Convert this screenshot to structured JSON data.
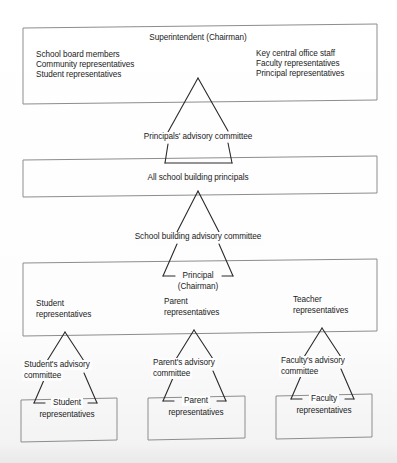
{
  "figure": {
    "kind": "organizational-hierarchy-diagram",
    "levels": 5
  },
  "boxes": {
    "superintendent": {
      "title": "Superintendent (Chairman)",
      "left_column": [
        "School board members",
        "Community representatives",
        "Student representatives"
      ],
      "right_column": [
        "Key central office staff",
        "Faculty representatives",
        "Principal representatives"
      ]
    },
    "principals": {
      "title": "All school building principals"
    },
    "building": {
      "principal_line1": "Principal",
      "principal_line2": "(Chairman)",
      "groups": [
        {
          "line1": "Student",
          "line2": "representatives"
        },
        {
          "line1": "Parent",
          "line2": "representatives"
        },
        {
          "line1": "Teacher",
          "line2": "representatives"
        }
      ]
    },
    "bottom": [
      {
        "line1": "Student",
        "line2": "representatives"
      },
      {
        "line1": "Parent",
        "line2": "representatives"
      },
      {
        "line1": "Faculty",
        "line2": "representatives"
      }
    ]
  },
  "connectors": {
    "principals_advisory": "Principals' advisory committee",
    "school_building_advisory": "School building advisory committee",
    "advisory": [
      {
        "line1": "Student's advisory",
        "line2": "committee"
      },
      {
        "line1": "Parent's advisory",
        "line2": "committee"
      },
      {
        "line1": "Faculty's advisory",
        "line2": "committee"
      }
    ]
  },
  "style": {
    "ink": "#2a2a2a",
    "box_stroke": "#8d8d8d",
    "paper": "#fdfdfd"
  }
}
